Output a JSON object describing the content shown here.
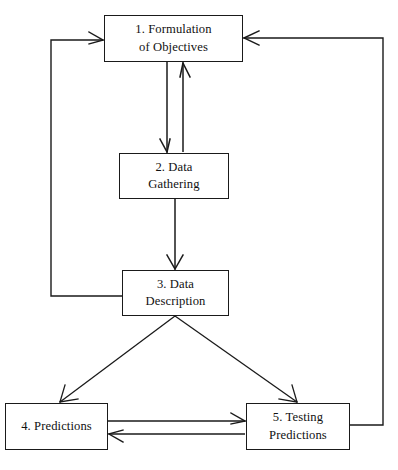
{
  "diagram": {
    "width": 398,
    "height": 470,
    "background_color": "#ffffff",
    "stroke_color": "#1a1a1a",
    "text_color": "#111111",
    "nodes": [
      {
        "id": "node-1",
        "label": "1. Formulation of Objectives",
        "line1": "1. Formulation",
        "line2": "of Objectives",
        "x": 104,
        "y": 15,
        "width": 139,
        "height": 47
      },
      {
        "id": "node-2",
        "label": "2. Data Gathering",
        "line1": "2. Data",
        "line2": "Gathering",
        "x": 119,
        "y": 153,
        "width": 110,
        "height": 46
      },
      {
        "id": "node-3",
        "label": "3. Data Description",
        "line1": "3. Data",
        "line2": "Description",
        "x": 122,
        "y": 270,
        "width": 107,
        "height": 46
      },
      {
        "id": "node-4",
        "label": "4. Predictions",
        "line1": "4. Predictions",
        "line2": "",
        "x": 5,
        "y": 403,
        "width": 103,
        "height": 47
      },
      {
        "id": "node-5",
        "label": "5. Testing Predictions",
        "line1": "5. Testing",
        "line2": "Predictions",
        "x": 246,
        "y": 403,
        "width": 104,
        "height": 47
      }
    ],
    "edges": [
      {
        "id": "edge-1-to-2",
        "from": "node-1",
        "to": "node-2",
        "type": "straight-down",
        "arrowhead": "end"
      },
      {
        "id": "edge-2-to-1",
        "from": "node-2",
        "to": "node-1",
        "type": "straight-up",
        "arrowhead": "end"
      },
      {
        "id": "edge-2-to-3",
        "from": "node-2",
        "to": "node-3",
        "type": "straight-down",
        "arrowhead": "end"
      },
      {
        "id": "edge-3-to-4",
        "from": "node-3",
        "to": "node-4",
        "type": "diagonal",
        "arrowhead": "end"
      },
      {
        "id": "edge-3-to-5",
        "from": "node-3",
        "to": "node-5",
        "type": "diagonal",
        "arrowhead": "end"
      },
      {
        "id": "edge-4-to-5",
        "from": "node-4",
        "to": "node-5",
        "type": "horizontal",
        "arrowhead": "end"
      },
      {
        "id": "edge-5-to-4",
        "from": "node-5",
        "to": "node-4",
        "type": "horizontal",
        "arrowhead": "end"
      },
      {
        "id": "edge-3-to-1-feedback-left",
        "from": "node-3",
        "to": "node-1",
        "type": "orthogonal-left-loop",
        "arrowhead": "end"
      },
      {
        "id": "edge-5-to-1-feedback-right",
        "from": "node-5",
        "to": "node-1",
        "type": "orthogonal-right-loop",
        "arrowhead": "end"
      }
    ]
  }
}
